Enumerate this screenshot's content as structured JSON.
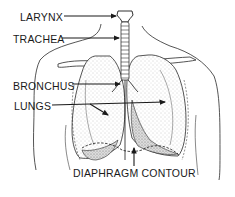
{
  "labels": {
    "larynx": "LARYNX",
    "trachea": "TRACHEA",
    "bronchus": "BRONCHUS",
    "lungs": "LUNGS",
    "diaphragm": "DIAPHRAGM CONTOUR"
  },
  "colors": {
    "ink": "#1a1a1a",
    "stipple": "#8a8a8a",
    "background": "#ffffff"
  }
}
